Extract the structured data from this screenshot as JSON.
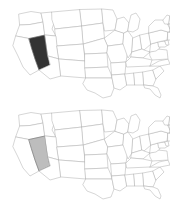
{
  "figure": {
    "background_color": "#ffffff",
    "panel_count": 2,
    "width": 170,
    "height": 203
  },
  "style": {
    "state_fill": "#ffffff",
    "state_border_color": "#b4b4b4",
    "outline_color": "#9a9a9a",
    "highlight_border_color": "#6e6e6e"
  },
  "panels": [
    {
      "id": "map-top",
      "name": "united-states-map-dark-highlight",
      "highlighted_state": "Nevada",
      "highlighted_state_abbr": "NV",
      "highlight_color": "#333333",
      "label": "United States map with Nevada shaded dark"
    },
    {
      "id": "map-bottom",
      "name": "united-states-map-light-highlight",
      "highlighted_state": "Nevada",
      "highlighted_state_abbr": "NV",
      "highlight_color": "#bdbdbd",
      "label": "United States map with Nevada shaded light gray"
    }
  ],
  "states": [
    {
      "abbr": "WA",
      "name": "Washington"
    },
    {
      "abbr": "OR",
      "name": "Oregon"
    },
    {
      "abbr": "CA",
      "name": "California"
    },
    {
      "abbr": "NV",
      "name": "Nevada"
    },
    {
      "abbr": "ID",
      "name": "Idaho"
    },
    {
      "abbr": "MT",
      "name": "Montana"
    },
    {
      "abbr": "WY",
      "name": "Wyoming"
    },
    {
      "abbr": "UT",
      "name": "Utah"
    },
    {
      "abbr": "AZ",
      "name": "Arizona"
    },
    {
      "abbr": "CO",
      "name": "Colorado"
    },
    {
      "abbr": "NM",
      "name": "New Mexico"
    },
    {
      "abbr": "ND",
      "name": "North Dakota"
    },
    {
      "abbr": "SD",
      "name": "South Dakota"
    },
    {
      "abbr": "NE",
      "name": "Nebraska"
    },
    {
      "abbr": "KS",
      "name": "Kansas"
    },
    {
      "abbr": "OK",
      "name": "Oklahoma"
    },
    {
      "abbr": "TX",
      "name": "Texas"
    },
    {
      "abbr": "MN",
      "name": "Minnesota"
    },
    {
      "abbr": "IA",
      "name": "Iowa"
    },
    {
      "abbr": "MO",
      "name": "Missouri"
    },
    {
      "abbr": "AR",
      "name": "Arkansas"
    },
    {
      "abbr": "LA",
      "name": "Louisiana"
    },
    {
      "abbr": "WI",
      "name": "Wisconsin"
    },
    {
      "abbr": "IL",
      "name": "Illinois"
    },
    {
      "abbr": "MS",
      "name": "Mississippi"
    },
    {
      "abbr": "MI",
      "name": "Michigan"
    },
    {
      "abbr": "IN",
      "name": "Indiana"
    },
    {
      "abbr": "OH",
      "name": "Ohio"
    },
    {
      "abbr": "KY",
      "name": "Kentucky"
    },
    {
      "abbr": "TN",
      "name": "Tennessee"
    },
    {
      "abbr": "AL",
      "name": "Alabama"
    },
    {
      "abbr": "GA",
      "name": "Georgia"
    },
    {
      "abbr": "FL",
      "name": "Florida"
    },
    {
      "abbr": "SC",
      "name": "South Carolina"
    },
    {
      "abbr": "NC",
      "name": "North Carolina"
    },
    {
      "abbr": "VA",
      "name": "Virginia"
    },
    {
      "abbr": "WV",
      "name": "West Virginia"
    },
    {
      "abbr": "MD",
      "name": "Maryland"
    },
    {
      "abbr": "DE",
      "name": "Delaware"
    },
    {
      "abbr": "PA",
      "name": "Pennsylvania"
    },
    {
      "abbr": "NJ",
      "name": "New Jersey"
    },
    {
      "abbr": "NY",
      "name": "New York"
    },
    {
      "abbr": "CT",
      "name": "Connecticut"
    },
    {
      "abbr": "RI",
      "name": "Rhode Island"
    },
    {
      "abbr": "MA",
      "name": "Massachusetts"
    },
    {
      "abbr": "VT",
      "name": "Vermont"
    },
    {
      "abbr": "NH",
      "name": "New Hampshire"
    },
    {
      "abbr": "ME",
      "name": "Maine"
    }
  ]
}
